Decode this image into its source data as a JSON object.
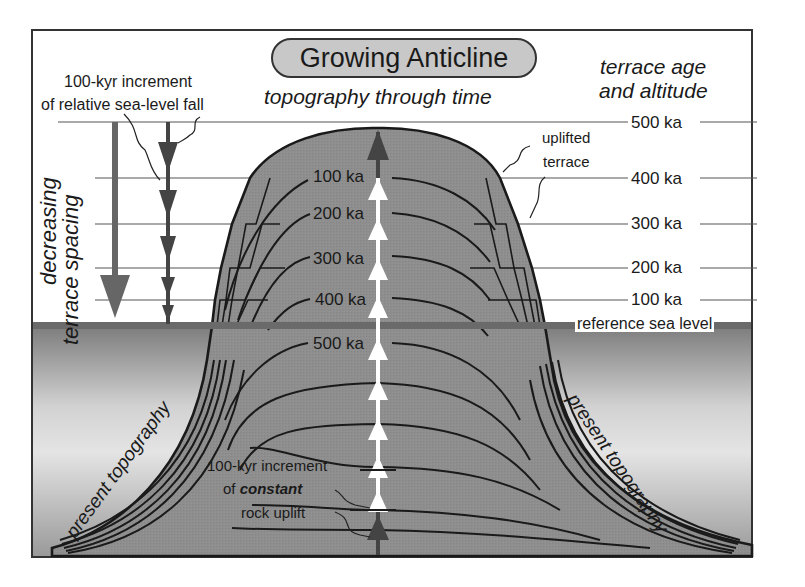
{
  "title": "Growing Anticline",
  "subtitle": "topography through time",
  "left_annotation": {
    "line1": "100-kyr increment",
    "line2": "of relative sea-level fall"
  },
  "vertical_label": {
    "line1": "decreasing",
    "line2": "terrace spacing"
  },
  "right_header": {
    "line1": "terrace age",
    "line2": "and altitude"
  },
  "uplifted_terrace_label": {
    "line1": "uplifted",
    "line2": "terrace"
  },
  "terrace_ages_right": [
    "500 ka",
    "400 ka",
    "300 ka",
    "200 ka",
    "100 ka"
  ],
  "topography_ages_center": [
    "100 ka",
    "200 ka",
    "300 ka",
    "400 ka",
    "500 ka"
  ],
  "reference_sea_level": "reference sea level",
  "present_topography_left": "present topography",
  "present_topography_right": "present topography",
  "uplift_annotation": {
    "line1": "100-kyr increment",
    "line2_prefix": "of ",
    "line2_emph": "constant",
    "line3": "rock uplift"
  },
  "colors": {
    "rock_fill": "#8c8c8c",
    "sea_gradient_top": "#7a7a7a",
    "sea_gradient_bottom": "#e6e6e6",
    "sea_level_band": "#6a6a6a",
    "title_pill": "#c8c8c8",
    "uplift_arrows": "#ffffff",
    "dark_arrow": "#555555"
  }
}
